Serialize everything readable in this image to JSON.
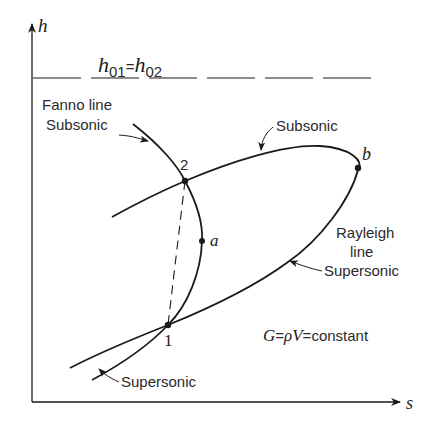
{
  "diagram": {
    "type": "h-s diagram (Fanno and Rayleigh lines)",
    "axes": {
      "y_label": "h",
      "x_label": "s"
    },
    "stagnation_line": {
      "label_lhs": "h",
      "label_lhs_sub": "01",
      "equals": "=",
      "label_rhs": "h",
      "label_rhs_sub": "02"
    },
    "fanno": {
      "title": "Fanno line",
      "upper_branch": "Subsonic",
      "lower_branch": "Supersonic"
    },
    "rayleigh": {
      "title_line1": "Rayleigh",
      "title_line2": "line",
      "upper_branch": "Subsonic",
      "lower_branch": "Supersonic"
    },
    "points": {
      "p1": "1",
      "p2": "2",
      "a": "a",
      "b": "b"
    },
    "equation": {
      "G": "G",
      "eq1": "=",
      "rho": "ρ",
      "V": "V",
      "eq2": "=",
      "text": "constant"
    }
  }
}
